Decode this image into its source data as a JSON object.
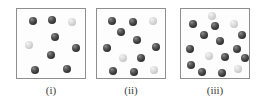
{
  "figure": {
    "background_color": "#ffffff",
    "box_border_color": "#8e8e8e",
    "box_fill_color": "#fdfdfd",
    "dark_sphere_color": "#3c3c3c",
    "light_sphere_color": "#d7d7d7",
    "sphere_diameter_px": 8
  },
  "panels": [
    {
      "label": "(i)",
      "left": 16,
      "total_count": 9,
      "dark_count": 7,
      "light_count": 2,
      "spheres": [
        {
          "x": 12,
          "y": 8,
          "shade": "dark",
          "size": 8
        },
        {
          "x": 31,
          "y": 7,
          "shade": "dark",
          "size": 8
        },
        {
          "x": 51,
          "y": 9,
          "shade": "light",
          "size": 8
        },
        {
          "x": 34,
          "y": 24,
          "shade": "dark",
          "size": 8
        },
        {
          "x": 8,
          "y": 32,
          "shade": "light",
          "size": 8
        },
        {
          "x": 55,
          "y": 35,
          "shade": "dark",
          "size": 8
        },
        {
          "x": 30,
          "y": 42,
          "shade": "dark",
          "size": 8
        },
        {
          "x": 14,
          "y": 57,
          "shade": "dark",
          "size": 8
        },
        {
          "x": 46,
          "y": 56,
          "shade": "dark",
          "size": 8
        }
      ]
    },
    {
      "label": "(ii)",
      "left": 96,
      "total_count": 12,
      "dark_count": 9,
      "light_count": 3,
      "spheres": [
        {
          "x": 11,
          "y": 8,
          "shade": "dark",
          "size": 8
        },
        {
          "x": 32,
          "y": 9,
          "shade": "dark",
          "size": 8
        },
        {
          "x": 52,
          "y": 8,
          "shade": "light",
          "size": 8
        },
        {
          "x": 20,
          "y": 19,
          "shade": "dark",
          "size": 8
        },
        {
          "x": 36,
          "y": 27,
          "shade": "dark",
          "size": 8
        },
        {
          "x": 6,
          "y": 35,
          "shade": "dark",
          "size": 8
        },
        {
          "x": 55,
          "y": 34,
          "shade": "dark",
          "size": 8
        },
        {
          "x": 22,
          "y": 45,
          "shade": "light",
          "size": 8
        },
        {
          "x": 40,
          "y": 45,
          "shade": "dark",
          "size": 8
        },
        {
          "x": 12,
          "y": 58,
          "shade": "dark",
          "size": 8
        },
        {
          "x": 33,
          "y": 59,
          "shade": "dark",
          "size": 8
        },
        {
          "x": 53,
          "y": 57,
          "shade": "light",
          "size": 8
        }
      ]
    },
    {
      "label": "(iii)",
      "left": 180,
      "total_count": 16,
      "dark_count": 12,
      "light_count": 4,
      "spheres": [
        {
          "x": 27,
          "y": 3,
          "shade": "light",
          "size": 8
        },
        {
          "x": 8,
          "y": 11,
          "shade": "dark",
          "size": 8
        },
        {
          "x": 30,
          "y": 13,
          "shade": "dark",
          "size": 8
        },
        {
          "x": 49,
          "y": 11,
          "shade": "light",
          "size": 8
        },
        {
          "x": 19,
          "y": 22,
          "shade": "dark",
          "size": 8
        },
        {
          "x": 57,
          "y": 22,
          "shade": "dark",
          "size": 8
        },
        {
          "x": 35,
          "y": 28,
          "shade": "dark",
          "size": 8
        },
        {
          "x": 5,
          "y": 36,
          "shade": "dark",
          "size": 8
        },
        {
          "x": 52,
          "y": 36,
          "shade": "dark",
          "size": 8
        },
        {
          "x": 24,
          "y": 43,
          "shade": "light",
          "size": 8
        },
        {
          "x": 40,
          "y": 44,
          "shade": "dark",
          "size": 8
        },
        {
          "x": 6,
          "y": 52,
          "shade": "dark",
          "size": 8
        },
        {
          "x": 17,
          "y": 59,
          "shade": "dark",
          "size": 8
        },
        {
          "x": 37,
          "y": 60,
          "shade": "dark",
          "size": 8
        },
        {
          "x": 53,
          "y": 56,
          "shade": "light",
          "size": 8
        },
        {
          "x": 60,
          "y": 45,
          "shade": "dark",
          "size": 8
        }
      ]
    }
  ]
}
